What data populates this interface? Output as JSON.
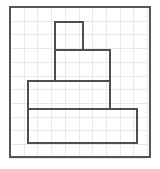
{
  "figure": {
    "canvas": {
      "width": 160,
      "height": 169,
      "background": "#ffffff"
    },
    "grid": {
      "visible": true,
      "color": "#e9e9e9",
      "line_width": 1,
      "cell_size": 13.7,
      "origin_x": 10,
      "origin_y": 7,
      "columns": 10,
      "rows": 11
    },
    "border": {
      "label": "outer-frame",
      "color": "#555555",
      "line_width": 2,
      "x": 10,
      "y": 7,
      "width": 140,
      "height": 150
    },
    "shape": {
      "label": "four-tier-stepped-figure",
      "stroke_color": "#4d4d4d",
      "stroke_width": 2,
      "fill": "none",
      "tiers": [
        {
          "name": "tier-1-top-square",
          "x": 55,
          "y": 22,
          "width": 28,
          "height": 28,
          "grid_units_w": 2,
          "grid_units_h": 2
        },
        {
          "name": "tier-2-upper-middle",
          "x": 55,
          "y": 50,
          "width": 55,
          "height": 31,
          "grid_units_w": 4,
          "grid_units_h": 2
        },
        {
          "name": "tier-3-lower-middle",
          "x": 28,
          "y": 81,
          "width": 82,
          "height": 28,
          "grid_units_w": 6,
          "grid_units_h": 2
        },
        {
          "name": "tier-4-base",
          "x": 28,
          "y": 109,
          "width": 109,
          "height": 34,
          "grid_units_w": 8,
          "grid_units_h": 2
        }
      ],
      "outline_path": "M 55 22 L 83 22 L 83 50 L 110 50 L 110 81 L 137 81 L 137 109 L 137 143 L 28 143 L 28 109 L 28 81 L 55 81 L 55 50 Z",
      "internal_divider_lines": [
        {
          "name": "divider-tier1-tier2",
          "x1": 55,
          "y1": 50,
          "x2": 83,
          "y2": 50
        },
        {
          "name": "divider-tier2-tier3",
          "x1": 55,
          "y1": 81,
          "x2": 110,
          "y2": 81
        },
        {
          "name": "divider-tier3-tier4",
          "x1": 28,
          "y1": 109,
          "x2": 110,
          "y2": 109
        },
        {
          "name": "edge-tier3-right",
          "x1": 110,
          "y1": 81,
          "x2": 110,
          "y2": 109
        },
        {
          "name": "edge-tier4-right",
          "x1": 137,
          "y1": 109,
          "x2": 137,
          "y2": 143
        }
      ]
    }
  }
}
